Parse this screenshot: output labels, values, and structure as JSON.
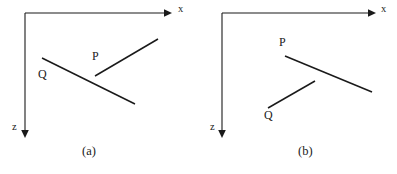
{
  "figure": {
    "width": 397,
    "height": 174,
    "background_color": "#ffffff",
    "ink_color": "#1a1a1a",
    "panel_count": 2
  },
  "panels": [
    {
      "id": "a",
      "caption": "(a)",
      "caption_position": {
        "x": 88,
        "y": 146
      },
      "axes": {
        "origin": {
          "x": 25,
          "y": 13
        },
        "x_axis": {
          "label": "x",
          "label_position": {
            "x": 178,
            "y": 8
          },
          "from": {
            "x": 25,
            "y": 13
          },
          "to": {
            "x": 168,
            "y": 13
          },
          "arrow": "right"
        },
        "z_axis": {
          "label": "z",
          "label_position": {
            "x": 13,
            "y": 125
          },
          "from": {
            "x": 25,
            "y": 13
          },
          "to": {
            "x": 25,
            "y": 136
          },
          "arrow": "down"
        }
      },
      "segments": [
        {
          "label": "P",
          "label_position": {
            "x": 92,
            "y": 52
          },
          "from": {
            "x": 95,
            "y": 76
          },
          "to": {
            "x": 158,
            "y": 39
          },
          "direction": "up-right"
        },
        {
          "label": "Q",
          "label_position": {
            "x": 39,
            "y": 70
          },
          "from": {
            "x": 42,
            "y": 58
          },
          "to": {
            "x": 135,
            "y": 104
          },
          "direction": "down-right"
        }
      ]
    },
    {
      "id": "b",
      "caption": "(b)",
      "caption_position": {
        "x": 306,
        "y": 146
      },
      "axes": {
        "origin": {
          "x": 222,
          "y": 13
        },
        "x_axis": {
          "label": "x",
          "label_position": {
            "x": 381,
            "y": 8
          },
          "from": {
            "x": 222,
            "y": 13
          },
          "to": {
            "x": 372,
            "y": 13
          },
          "arrow": "right"
        },
        "z_axis": {
          "label": "z",
          "label_position": {
            "x": 210,
            "y": 125
          },
          "from": {
            "x": 222,
            "y": 13
          },
          "to": {
            "x": 222,
            "y": 136
          },
          "arrow": "down"
        }
      },
      "segments": [
        {
          "label": "P",
          "label_position": {
            "x": 279,
            "y": 38
          },
          "from": {
            "x": 285,
            "y": 56
          },
          "to": {
            "x": 372,
            "y": 92
          },
          "direction": "down-right"
        },
        {
          "label": "Q",
          "label_position": {
            "x": 264,
            "y": 111
          },
          "from": {
            "x": 268,
            "y": 108
          },
          "to": {
            "x": 315,
            "y": 81
          },
          "direction": "up-right"
        }
      ]
    }
  ]
}
